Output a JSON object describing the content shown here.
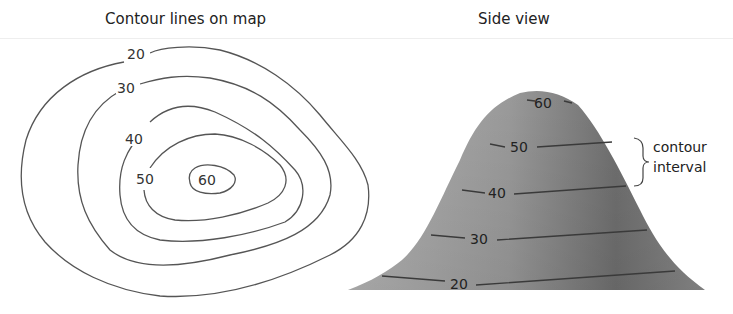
{
  "titles": {
    "map": "Contour lines on map",
    "side": "Side view"
  },
  "map_labels": [
    "20",
    "30",
    "40",
    "50",
    "60"
  ],
  "side_labels": [
    "60",
    "50",
    "40",
    "30",
    "20"
  ],
  "annotation": {
    "line1": "contour",
    "line2": "interval"
  },
  "colors": {
    "line": "#555555",
    "hill_light": "#a8a8a8",
    "hill_dark": "#6e6e6e"
  }
}
